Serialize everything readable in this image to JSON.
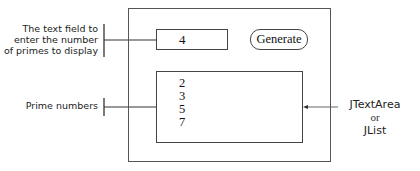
{
  "diagram": {
    "window": {
      "text_field_value": "4",
      "generate_button_label": "Generate",
      "prime_list": [
        "2",
        "3",
        "5",
        "7"
      ]
    },
    "annotations": {
      "text_field_label": [
        "The text field to",
        "enter the number",
        "of primes to display"
      ],
      "prime_numbers_label": "Prime numbers",
      "component_label": {
        "line1": "JTextArea",
        "line2": "or",
        "line3": "JList"
      }
    },
    "colors": {
      "line": "#444444",
      "text": "#222222",
      "background": "#ffffff"
    }
  }
}
